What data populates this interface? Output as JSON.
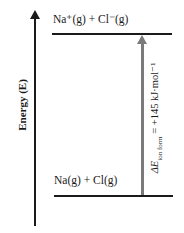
{
  "diagram": {
    "type": "energy-level-diagram",
    "y_axis_label": "Energy (E)",
    "levels": [
      {
        "name": "upper",
        "label": "Na⁺(g) + Cl⁻(g)"
      },
      {
        "name": "lower",
        "label": "Na(g) + Cl(g)"
      }
    ],
    "transition": {
      "symbol": "ΔE",
      "subscript": "ion form",
      "value": "= +145 kJ·mol⁻¹"
    },
    "colors": {
      "lines": "#1a1a1a",
      "transition_arrow": "#7a7a7a"
    }
  }
}
